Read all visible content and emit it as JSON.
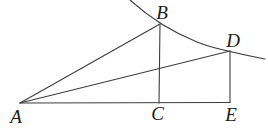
{
  "diagram": {
    "background_color": "#ffffff",
    "stroke_color": "#3d3d3d",
    "label_color": "#1c1c1c",
    "stroke_width": 1.1,
    "width": 268,
    "height": 129,
    "points": {
      "A": [
        20,
        103
      ],
      "B": [
        160,
        24
      ],
      "C": [
        159,
        103
      ],
      "D": [
        230,
        51
      ],
      "E": [
        230,
        102.5
      ]
    },
    "segments": [
      {
        "from": "A",
        "to": "B"
      },
      {
        "from": "A",
        "to": "D"
      },
      {
        "from": "A",
        "to": "E"
      },
      {
        "from": "B",
        "to": "C"
      },
      {
        "from": "D",
        "to": "E"
      }
    ],
    "curve": {
      "description": "arc passing through B and D, concave up, from top edge to right side",
      "path": "M130,0 Q160,27 197,42 Q214,49 265,59"
    },
    "labels": [
      {
        "text": "A",
        "x": 16,
        "y": 123,
        "anchor": "middle"
      },
      {
        "text": "B",
        "x": 162,
        "y": 19,
        "anchor": "middle"
      },
      {
        "text": "C",
        "x": 157.5,
        "y": 120,
        "anchor": "middle"
      },
      {
        "text": "D",
        "x": 233,
        "y": 47,
        "anchor": "middle"
      },
      {
        "text": "E",
        "x": 231,
        "y": 121,
        "anchor": "middle"
      }
    ],
    "label_font_size": 19
  }
}
